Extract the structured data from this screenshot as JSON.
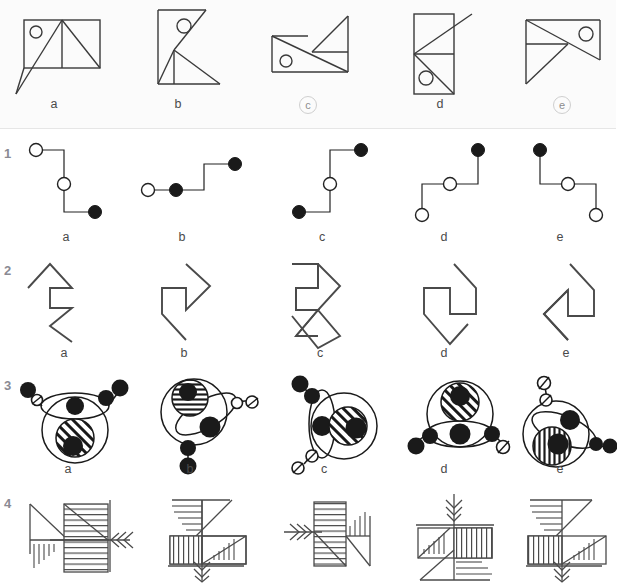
{
  "page": {
    "background": "#ffffff",
    "ink": "#3a3a3a",
    "panel_background": "#fbfbfb",
    "cut_off_header_text": ""
  },
  "example_panel": {
    "name": "example-row",
    "labels": [
      {
        "text": "a",
        "circled": false
      },
      {
        "text": "b",
        "circled": false
      },
      {
        "text": "c",
        "circled": true
      },
      {
        "text": "d",
        "circled": false
      },
      {
        "text": "e",
        "circled": true
      }
    ]
  },
  "rows": [
    {
      "number": "1",
      "name": "row-nodes-and-lines",
      "labels": [
        {
          "text": "a",
          "circled": false
        },
        {
          "text": "b",
          "circled": false
        },
        {
          "text": "c",
          "circled": false
        },
        {
          "text": "d",
          "circled": false
        },
        {
          "text": "e",
          "circled": false
        }
      ]
    },
    {
      "number": "2",
      "name": "row-zigzag-arrows",
      "labels": [
        {
          "text": "a",
          "circled": false
        },
        {
          "text": "b",
          "circled": false
        },
        {
          "text": "c",
          "circled": false
        },
        {
          "text": "d",
          "circled": false
        },
        {
          "text": "e",
          "circled": false
        }
      ]
    },
    {
      "number": "3",
      "name": "row-circles-and-beads",
      "labels": [
        {
          "text": "a",
          "circled": false
        },
        {
          "text": "b",
          "circled": false
        },
        {
          "text": "c",
          "circled": false
        },
        {
          "text": "d",
          "circled": false
        },
        {
          "text": "e",
          "circled": false
        }
      ]
    },
    {
      "number": "4",
      "name": "row-hatched-blocks",
      "labels": [
        {
          "text": "a",
          "circled": false
        },
        {
          "text": "b",
          "circled": false
        },
        {
          "text": "c",
          "circled": false
        },
        {
          "text": "d",
          "circled": false
        },
        {
          "text": "e",
          "circled": false
        }
      ]
    }
  ]
}
